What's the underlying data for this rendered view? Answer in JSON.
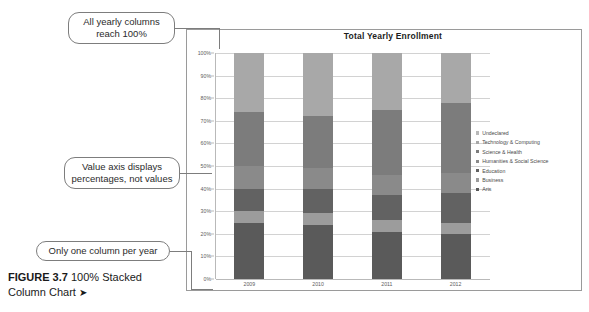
{
  "chart_data": {
    "type": "bar",
    "subtype": "100% stacked column",
    "title": "Total Yearly Enrollment",
    "xlabel": "",
    "ylabel": "",
    "ylim": [
      0,
      100
    ],
    "y_unit": "%",
    "grid": true,
    "legend_position": "right",
    "categories": [
      "2009",
      "2010",
      "2011",
      "2012"
    ],
    "y_ticks": [
      "0%",
      "10%",
      "20%",
      "30%",
      "40%",
      "50%",
      "60%",
      "70%",
      "80%",
      "90%",
      "100%"
    ],
    "y_tick_values": [
      0,
      10,
      20,
      30,
      40,
      50,
      60,
      70,
      80,
      90,
      100
    ],
    "series": [
      {
        "name": "Arts",
        "color": "#5a5a5a",
        "values": [
          25,
          24,
          21,
          20
        ]
      },
      {
        "name": "Business",
        "color": "#9c9c9c",
        "values": [
          5,
          5,
          5,
          5
        ]
      },
      {
        "name": "Education",
        "color": "#626262",
        "values": [
          10,
          11,
          11,
          13
        ]
      },
      {
        "name": "Humanities & Social Science",
        "color": "#8a8a8a",
        "values": [
          10,
          9,
          9,
          9
        ]
      },
      {
        "name": "Science & Health",
        "color": "#7c7c7c",
        "values": [
          24,
          23,
          29,
          31
        ]
      },
      {
        "name": "Technology & Computing",
        "color": "#a8a8a8",
        "values": [
          26,
          28,
          25,
          22
        ]
      },
      {
        "name": "Undeclared",
        "color": "#b9b9b9",
        "values": [
          0,
          0,
          0,
          0
        ]
      }
    ],
    "legend_entries": [
      "Undeclared",
      "Technology & Computing",
      "Science & Health",
      "Humanities & Social Science",
      "Education",
      "Business",
      "Arts"
    ]
  },
  "callouts": {
    "reach_100": "All yearly columns reach 100%",
    "value_axis": "Value axis displays percentages, not values",
    "one_column": "Only one column per year"
  },
  "caption": {
    "figure_label": "FIGURE 3.7",
    "text": "100% Stacked Column Chart",
    "arrow": "➤"
  }
}
